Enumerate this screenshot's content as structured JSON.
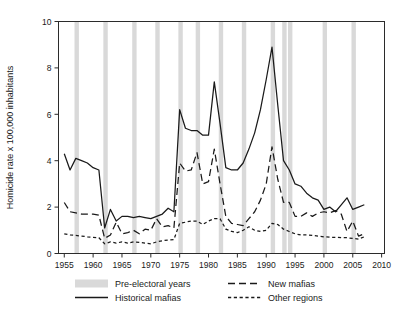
{
  "chart_data": {
    "type": "line",
    "title": "",
    "xlabel": "",
    "ylabel": "Homicide rate x 100,000 inhabitants",
    "xlim": [
      1954,
      2010.5
    ],
    "ylim": [
      0,
      10
    ],
    "xticks": [
      1955,
      1960,
      1965,
      1970,
      1975,
      1980,
      1985,
      1990,
      1995,
      2000,
      2005,
      2010
    ],
    "yticks": [
      0,
      2,
      4,
      6,
      8,
      10
    ],
    "grid": false,
    "legend_position": "bottom",
    "x": [
      1955,
      1956,
      1957,
      1958,
      1959,
      1960,
      1961,
      1962,
      1963,
      1964,
      1965,
      1966,
      1967,
      1968,
      1969,
      1970,
      1971,
      1972,
      1973,
      1974,
      1975,
      1976,
      1977,
      1978,
      1979,
      1980,
      1981,
      1982,
      1983,
      1984,
      1985,
      1986,
      1987,
      1988,
      1989,
      1990,
      1991,
      1992,
      1993,
      1994,
      1995,
      1996,
      1997,
      1998,
      1999,
      2000,
      2001,
      2002,
      2003,
      2004,
      2005,
      2006,
      2007
    ],
    "series": [
      {
        "name": "Historical mafias",
        "style": "solid",
        "color": "#1a1a1a",
        "values": [
          4.3,
          3.6,
          4.1,
          4.0,
          3.9,
          3.7,
          3.6,
          1.1,
          1.9,
          1.4,
          1.6,
          1.6,
          1.55,
          1.6,
          1.55,
          1.5,
          1.6,
          1.7,
          1.95,
          1.8,
          6.2,
          5.4,
          5.3,
          5.3,
          5.1,
          5.1,
          7.4,
          5.6,
          3.7,
          3.6,
          3.6,
          3.9,
          4.5,
          5.2,
          6.2,
          7.5,
          8.9,
          6.4,
          4.0,
          3.6,
          3.0,
          2.9,
          2.6,
          2.4,
          2.3,
          1.9,
          2.0,
          1.8,
          2.1,
          2.4,
          1.9,
          2.0,
          2.1
        ]
      },
      {
        "name": "New mafias",
        "style": "dashed-long",
        "color": "#1a1a1a",
        "values": [
          2.2,
          1.8,
          1.75,
          1.7,
          1.7,
          1.7,
          1.65,
          0.65,
          0.8,
          1.35,
          0.85,
          0.9,
          1.0,
          0.85,
          1.05,
          1.0,
          1.5,
          1.15,
          1.2,
          1.1,
          3.9,
          3.55,
          3.6,
          4.35,
          3.0,
          3.1,
          4.5,
          3.0,
          1.6,
          1.3,
          1.25,
          1.2,
          1.5,
          1.8,
          2.3,
          3.0,
          4.6,
          3.2,
          2.2,
          2.2,
          1.6,
          1.6,
          1.75,
          1.6,
          1.75,
          1.8,
          1.75,
          1.85,
          1.7,
          0.95,
          1.4,
          0.75,
          0.85
        ]
      },
      {
        "name": "Other regions",
        "style": "dashed-short",
        "color": "#1a1a1a",
        "values": [
          0.85,
          0.8,
          0.78,
          0.75,
          0.72,
          0.7,
          0.68,
          0.42,
          0.5,
          0.45,
          0.5,
          0.45,
          0.5,
          0.48,
          0.45,
          0.42,
          0.5,
          0.55,
          0.58,
          0.6,
          1.3,
          1.35,
          1.4,
          1.4,
          1.25,
          1.4,
          1.5,
          1.5,
          1.05,
          0.95,
          0.9,
          1.0,
          1.15,
          1.0,
          0.95,
          1.0,
          1.3,
          1.25,
          1.05,
          0.95,
          0.85,
          0.8,
          0.8,
          0.78,
          0.75,
          0.72,
          0.7,
          0.7,
          0.68,
          0.68,
          0.65,
          0.62,
          0.72
        ]
      }
    ],
    "shaded_bands": {
      "name": "Pre-electoral years",
      "color": "#d9d9d9",
      "years": [
        1957,
        1962,
        1967,
        1971,
        1975,
        1978,
        1982,
        1986,
        1991,
        1993,
        1994,
        2000,
        2005
      ]
    }
  },
  "legend": {
    "entries": [
      {
        "label": "Pre-electoral years",
        "marker": "band-swatch"
      },
      {
        "label": "Historical mafias",
        "marker": "solid-line"
      },
      {
        "label": "New mafias",
        "marker": "dashed-long-line"
      },
      {
        "label": "Other regions",
        "marker": "dashed-short-line"
      }
    ]
  }
}
